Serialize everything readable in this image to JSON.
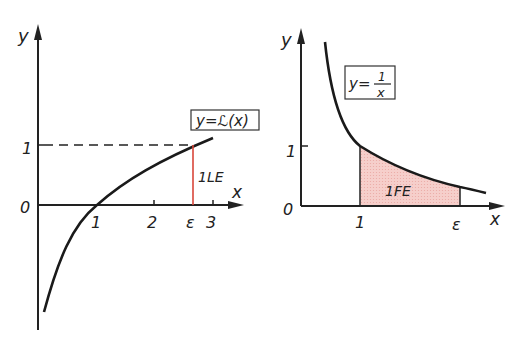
{
  "left_plot": {
    "y_axis_label": "y",
    "x_axis_label": "x",
    "origin_label": "0",
    "y_tick_1": "1",
    "x_ticks": [
      "1",
      "2",
      "ε",
      "3"
    ],
    "function_label": "y=ℒ(x)",
    "segment_label": "1LE",
    "colors": {
      "curve": "#1a1a1a",
      "segment": "#d9473a"
    }
  },
  "right_plot": {
    "y_axis_label": "y",
    "x_axis_label": "x",
    "origin_label": "0",
    "y_tick_1": "1",
    "x_ticks": [
      "1",
      "ε"
    ],
    "function_label_prefix": "y=",
    "function_label_num": "1",
    "function_label_den": "x",
    "area_label": "1FE",
    "colors": {
      "curve": "#1a1a1a",
      "area_fill": "#f5c6c2"
    }
  }
}
